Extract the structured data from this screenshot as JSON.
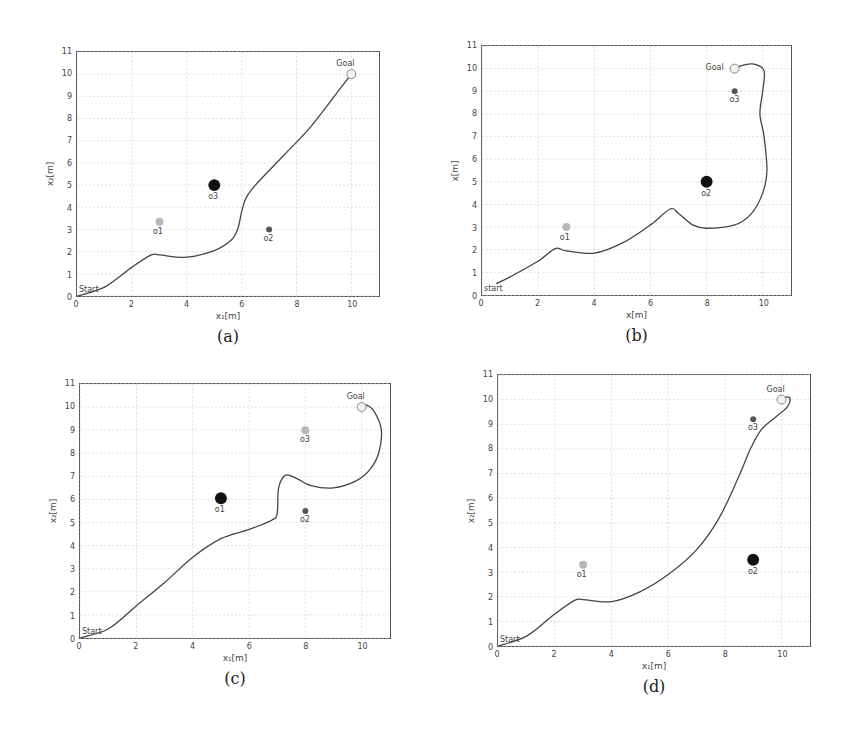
{
  "chart_data": [
    {
      "type": "line",
      "panel": "a",
      "caption": "(a)",
      "xlabel": "x₁[m]",
      "ylabel": "x₂[m]",
      "xlim": [
        0,
        11
      ],
      "ylim": [
        0,
        11
      ],
      "xticks": [
        0,
        2,
        4,
        6,
        8,
        10
      ],
      "yticks": [
        0,
        1,
        2,
        3,
        4,
        5,
        6,
        7,
        8,
        9,
        10,
        11
      ],
      "grid": true,
      "start_label": "Start",
      "goal_label": "Goal",
      "goal": [
        10,
        10
      ],
      "obstacles": [
        {
          "name": "o1",
          "x": 3,
          "y": 3.35,
          "size": "medium",
          "color": "#b8b8b8"
        },
        {
          "name": "o2",
          "x": 7,
          "y": 3,
          "size": "small",
          "color": "#555555"
        },
        {
          "name": "o3",
          "x": 5,
          "y": 5,
          "size": "large",
          "color": "#111111"
        }
      ],
      "trajectory": [
        [
          0,
          0
        ],
        [
          1,
          0.4
        ],
        [
          2,
          1.3
        ],
        [
          2.7,
          1.85
        ],
        [
          3,
          1.85
        ],
        [
          4,
          1.75
        ],
        [
          5,
          2.05
        ],
        [
          5.6,
          2.5
        ],
        [
          5.85,
          3.0
        ],
        [
          6.0,
          3.8
        ],
        [
          6.15,
          4.4
        ],
        [
          6.5,
          5.0
        ],
        [
          7.5,
          6.3
        ],
        [
          8.5,
          7.6
        ],
        [
          9.5,
          9.2
        ],
        [
          10,
          10
        ]
      ]
    },
    {
      "type": "line",
      "panel": "b",
      "caption": "(b)",
      "xlabel": "x[m]",
      "ylabel": "x[m]",
      "xlim": [
        0,
        11
      ],
      "ylim": [
        0,
        11
      ],
      "xticks": [
        0,
        2,
        4,
        6,
        8,
        10
      ],
      "yticks": [
        0,
        1,
        2,
        3,
        4,
        5,
        6,
        7,
        8,
        9,
        10,
        11
      ],
      "grid": true,
      "start_label": "start",
      "goal_label": "Goal",
      "goal": [
        9,
        10
      ],
      "obstacles": [
        {
          "name": "o1",
          "x": 3,
          "y": 3,
          "size": "medium",
          "color": "#b8b8b8"
        },
        {
          "name": "o2",
          "x": 8,
          "y": 5,
          "size": "large",
          "color": "#111111"
        },
        {
          "name": "o3",
          "x": 9,
          "y": 9,
          "size": "small",
          "color": "#555555"
        }
      ],
      "trajectory": [
        [
          0.5,
          0.5
        ],
        [
          1,
          0.8
        ],
        [
          2,
          1.5
        ],
        [
          2.6,
          2.05
        ],
        [
          3,
          1.95
        ],
        [
          4,
          1.85
        ],
        [
          5,
          2.3
        ],
        [
          6,
          3.1
        ],
        [
          6.7,
          3.8
        ],
        [
          7,
          3.6
        ],
        [
          7.5,
          3.1
        ],
        [
          8,
          2.95
        ],
        [
          9,
          3.1
        ],
        [
          9.6,
          3.6
        ],
        [
          10,
          4.5
        ],
        [
          10.15,
          5.5
        ],
        [
          10.05,
          7
        ],
        [
          9.9,
          8
        ],
        [
          10,
          9
        ],
        [
          10.05,
          9.9
        ],
        [
          9.7,
          10.2
        ],
        [
          9.3,
          10.15
        ],
        [
          9,
          10
        ]
      ]
    },
    {
      "type": "line",
      "panel": "c",
      "caption": "(c)",
      "xlabel": "x₁[m]",
      "ylabel": "x₂[m]",
      "xlim": [
        0,
        11
      ],
      "ylim": [
        0,
        11
      ],
      "xticks": [
        0,
        2,
        4,
        6,
        8,
        10
      ],
      "yticks": [
        0,
        1,
        2,
        3,
        4,
        5,
        6,
        7,
        8,
        9,
        10,
        11
      ],
      "grid": true,
      "start_label": "Start",
      "goal_label": "Goal",
      "goal": [
        10,
        10
      ],
      "obstacles": [
        {
          "name": "o1",
          "x": 5,
          "y": 6.05,
          "size": "large",
          "color": "#111111"
        },
        {
          "name": "o2",
          "x": 8,
          "y": 5.5,
          "size": "small",
          "color": "#555555"
        },
        {
          "name": "o3",
          "x": 8,
          "y": 9,
          "size": "medium",
          "color": "#b8b8b8"
        }
      ],
      "trajectory": [
        [
          0,
          0
        ],
        [
          1,
          0.4
        ],
        [
          2,
          1.4
        ],
        [
          3,
          2.4
        ],
        [
          4,
          3.5
        ],
        [
          5,
          4.3
        ],
        [
          6,
          4.7
        ],
        [
          6.8,
          5.1
        ],
        [
          7,
          5.4
        ],
        [
          7.05,
          6.5
        ],
        [
          7.3,
          7.05
        ],
        [
          7.7,
          6.9
        ],
        [
          8.2,
          6.6
        ],
        [
          9,
          6.5
        ],
        [
          9.8,
          6.8
        ],
        [
          10.3,
          7.3
        ],
        [
          10.6,
          8
        ],
        [
          10.7,
          9
        ],
        [
          10.45,
          9.8
        ],
        [
          10.15,
          10.1
        ],
        [
          10,
          10
        ]
      ]
    },
    {
      "type": "line",
      "panel": "d",
      "caption": "(d)",
      "xlabel": "x₁[m]",
      "ylabel": "x₂[m]",
      "xlim": [
        0,
        11
      ],
      "ylim": [
        0,
        11
      ],
      "xticks": [
        0,
        2,
        4,
        6,
        8,
        10
      ],
      "yticks": [
        0,
        1,
        2,
        3,
        4,
        5,
        6,
        7,
        8,
        9,
        10,
        11
      ],
      "grid": true,
      "start_label": "Start",
      "goal_label": "Goal",
      "goal": [
        10,
        10
      ],
      "obstacles": [
        {
          "name": "o1",
          "x": 3,
          "y": 3.3,
          "size": "medium",
          "color": "#b8b8b8"
        },
        {
          "name": "o2",
          "x": 9,
          "y": 3.5,
          "size": "large",
          "color": "#111111"
        },
        {
          "name": "o3",
          "x": 9,
          "y": 9.2,
          "size": "small",
          "color": "#555555"
        }
      ],
      "trajectory": [
        [
          0,
          0
        ],
        [
          1,
          0.4
        ],
        [
          2,
          1.3
        ],
        [
          2.7,
          1.85
        ],
        [
          3,
          1.88
        ],
        [
          4,
          1.8
        ],
        [
          5,
          2.2
        ],
        [
          6,
          2.9
        ],
        [
          7,
          3.9
        ],
        [
          7.8,
          5.2
        ],
        [
          8.5,
          6.9
        ],
        [
          8.9,
          8
        ],
        [
          9.3,
          8.8
        ],
        [
          9.8,
          9.3
        ],
        [
          10.2,
          9.7
        ],
        [
          10.3,
          10.05
        ],
        [
          10.1,
          10.1
        ],
        [
          10,
          10
        ]
      ]
    }
  ],
  "layout": {
    "panels": [
      {
        "left": 76,
        "top": 51,
        "width": 304,
        "height": 246
      },
      {
        "left": 481,
        "top": 45,
        "width": 311,
        "height": 251
      },
      {
        "left": 79,
        "top": 383,
        "width": 312,
        "height": 256
      },
      {
        "left": 497,
        "top": 374,
        "width": 314,
        "height": 273
      }
    ]
  },
  "colors": {
    "trajectory": "#444444",
    "grid": "#d8d8d8",
    "axis": "#555555"
  }
}
